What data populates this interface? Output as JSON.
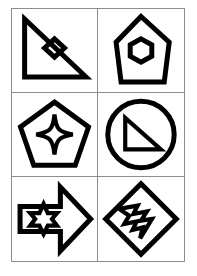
{
  "page": {
    "background_color": "#ffffff",
    "stroke_color": "#000000",
    "grid_border_color": "#8d8d8d",
    "columns": 2,
    "rows": 3
  },
  "grid": {
    "cells": [
      {
        "index": 1,
        "position": "row1-col1",
        "outer_shape": "right-triangle",
        "outer_shape_label": "Right Triangle",
        "outer_orientation": "right angle at top-left, hypotenuse from top-left to bottom-right",
        "inner_shape": "diamond",
        "inner_shape_label": "Diamond",
        "fill": "none",
        "outline": "black"
      },
      {
        "index": 2,
        "position": "row1-col2",
        "outer_shape": "elongated-pentagon",
        "outer_shape_label": "Elongated Pentagon",
        "outer_orientation": "apex pointing up",
        "inner_shape": "hexagon",
        "inner_shape_label": "Hexagon",
        "fill": "none",
        "outline": "black"
      },
      {
        "index": 3,
        "position": "row2-col1",
        "outer_shape": "pentagon",
        "outer_shape_label": "Pentagon",
        "outer_orientation": "apex pointing up",
        "inner_shape": "four-pointed-star",
        "inner_shape_label": "Four Pointed Star",
        "fill": "none",
        "outline": "black"
      },
      {
        "index": 4,
        "position": "row2-col2",
        "outer_shape": "circle",
        "outer_shape_label": "Circle",
        "outer_orientation": "none",
        "inner_shape": "right-triangle",
        "inner_shape_label": "Right Triangle",
        "fill": "none",
        "outline": "black"
      },
      {
        "index": 5,
        "position": "row3-col1",
        "outer_shape": "arrow-right",
        "outer_shape_label": "Right Arrow",
        "outer_orientation": "pointing right",
        "inner_shape": "six-pointed-star",
        "inner_shape_label": "Six Pointed Star",
        "fill": "none",
        "outline": "black"
      },
      {
        "index": 6,
        "position": "row3-col2",
        "outer_shape": "diamond",
        "outer_shape_label": "Diamond",
        "outer_orientation": "rotated square",
        "inner_shape": "lightning-bolt",
        "inner_shape_label": "Lightning Bolt",
        "fill": "none",
        "outline": "black"
      }
    ]
  }
}
